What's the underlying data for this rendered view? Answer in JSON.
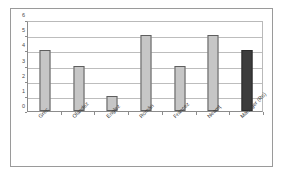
{
  "chart_data": {
    "type": "bar",
    "title": "",
    "subtitle": "",
    "xlabel": "",
    "ylabel": "",
    "categories": [
      "Grec",
      "Olandez",
      "Englez",
      "Român",
      "Francez",
      "Neamţ",
      "Manager (Ro)"
    ],
    "values": [
      4,
      3,
      1,
      5,
      3,
      5,
      4
    ],
    "series": [
      {
        "name": "",
        "values": [
          4,
          3,
          1,
          5,
          3,
          5,
          4
        ]
      }
    ],
    "ylim": [
      0,
      6
    ],
    "y_ticks": [
      0,
      1,
      2,
      3,
      4,
      5,
      6
    ],
    "y_tick_labels": [
      "0",
      "1",
      "2",
      "3",
      "4",
      "5",
      "6"
    ],
    "grid": true,
    "legend": false,
    "legend_position": "none",
    "bar_styles": [
      "light",
      "light",
      "light",
      "light",
      "light",
      "light",
      "dark"
    ],
    "colors": {
      "bar_light_fill": "#c6c6c6",
      "bar_light_border": "#5e5e5e",
      "bar_dark_fill": "#3c3c3c",
      "bar_dark_border": "#2a2a2a",
      "gridline": "#bdbdbd",
      "axis": "#8c8c8c",
      "frame_border": "#9a9a9a",
      "plot_background": "#ffffff",
      "tick_label": "#4a4a4a",
      "category_label": "#3a3a3a"
    }
  }
}
